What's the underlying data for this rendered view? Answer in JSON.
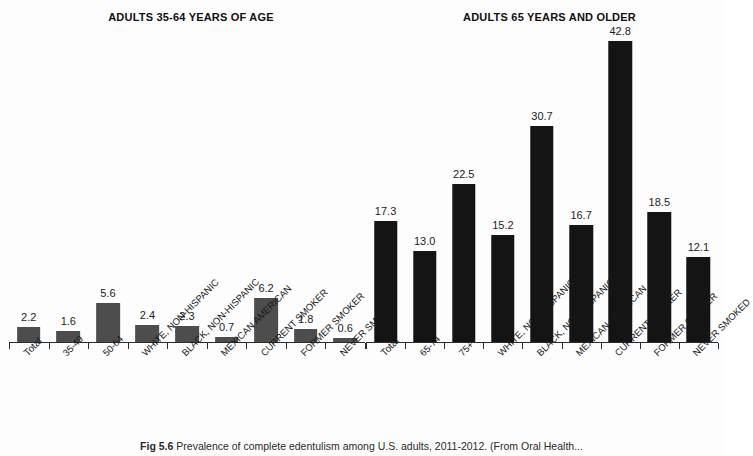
{
  "figure": {
    "caption_label": "Fig 5.6",
    "caption_text": "Prevalence of complete edentulism among U.S. adults, 2011-2012. (From Oral Health..."
  },
  "colors": {
    "left_bar": "#4d4d4d",
    "right_bar": "#141414",
    "axis": "#2b2b2b",
    "background": "#fdfdfd",
    "text": "#1a1a1a"
  },
  "chart_data": [
    {
      "type": "bar",
      "title": "ADULTS 35-64 YEARS OF AGE",
      "xlabel": "",
      "ylabel": "",
      "ylim": [
        0,
        45
      ],
      "grid": false,
      "legend": "none",
      "bar_color": "#4d4d4d",
      "categories": [
        "Total",
        "35-49",
        "50-64",
        "WHITE, NON-HISPANIC",
        "BLACK, NON-HISPANIC",
        "MEXICAN AMERICAN",
        "CURRENT SMOKER",
        "FORMER SMOKER",
        "NEVER SMOKED"
      ],
      "values": [
        2.2,
        1.6,
        5.6,
        2.4,
        2.3,
        0.7,
        6.2,
        1.8,
        0.6
      ],
      "data_labels": [
        "2.2",
        "1.6",
        "5.6",
        "2.4",
        "2.3",
        "0.7",
        "6.2",
        "1.8",
        "0.6"
      ]
    },
    {
      "type": "bar",
      "title": "ADULTS 65 YEARS AND OLDER",
      "xlabel": "",
      "ylabel": "",
      "ylim": [
        0,
        45
      ],
      "grid": false,
      "legend": "none",
      "bar_color": "#141414",
      "categories": [
        "Total",
        "65-74",
        "75+",
        "WHITE, NON-HISPANIC",
        "BLACK, NON-HISPANIC",
        "MEXICAN AMERICAN",
        "CURRENT SMOKER",
        "FORMER SMOKER",
        "NEVER SMOKED"
      ],
      "values": [
        17.3,
        13.0,
        22.5,
        15.2,
        30.7,
        16.7,
        42.8,
        18.5,
        12.1
      ],
      "data_labels": [
        "17.3",
        "13.0",
        "22.5",
        "15.2",
        "30.7",
        "16.7",
        "42.8",
        "18.5",
        "12.1"
      ]
    }
  ]
}
